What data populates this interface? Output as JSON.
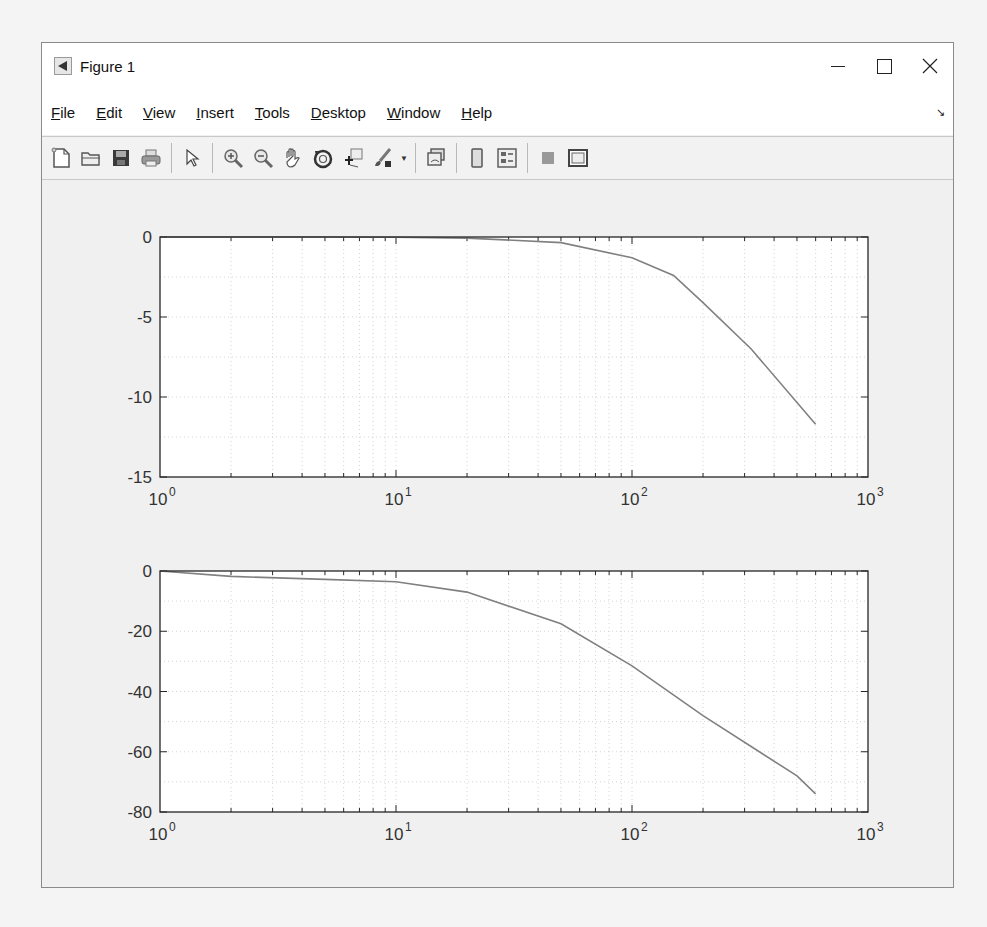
{
  "window": {
    "title": "Figure 1",
    "controls": [
      "minimize",
      "maximize",
      "close"
    ]
  },
  "menubar": {
    "items": [
      {
        "label": "File",
        "mnemonic": "F"
      },
      {
        "label": "Edit",
        "mnemonic": "E"
      },
      {
        "label": "View",
        "mnemonic": "V"
      },
      {
        "label": "Insert",
        "mnemonic": "I"
      },
      {
        "label": "Tools",
        "mnemonic": "T"
      },
      {
        "label": "Desktop",
        "mnemonic": "D"
      },
      {
        "label": "Window",
        "mnemonic": "W"
      },
      {
        "label": "Help",
        "mnemonic": "H"
      }
    ],
    "dock_arrow": "↘"
  },
  "toolbar": {
    "buttons": [
      {
        "name": "new-figure",
        "icon": "new-file-icon"
      },
      {
        "name": "open-file",
        "icon": "folder-open-icon"
      },
      {
        "name": "save",
        "icon": "save-icon"
      },
      {
        "name": "print",
        "icon": "printer-icon"
      },
      {
        "name": "edit-plot",
        "icon": "pointer-arrow-icon"
      },
      {
        "name": "zoom-in",
        "icon": "zoom-in-icon"
      },
      {
        "name": "zoom-out",
        "icon": "zoom-out-icon"
      },
      {
        "name": "pan",
        "icon": "hand-icon"
      },
      {
        "name": "rotate-3d",
        "icon": "rotate-3d-icon"
      },
      {
        "name": "data-cursor",
        "icon": "data-cursor-icon"
      },
      {
        "name": "brush",
        "icon": "brush-icon"
      },
      {
        "name": "link-plot",
        "icon": "link-plot-icon"
      },
      {
        "name": "colorbar",
        "icon": "colorbar-icon"
      },
      {
        "name": "legend",
        "icon": "legend-icon"
      },
      {
        "name": "hide-plot-tools",
        "icon": "hide-plot-tools-icon"
      },
      {
        "name": "show-plot-tools",
        "icon": "show-plot-tools-icon"
      }
    ]
  },
  "chart_data": [
    {
      "type": "line",
      "title": "",
      "xlabel": "",
      "ylabel": "",
      "xscale": "log",
      "xlim": [
        1,
        1000
      ],
      "ylim": [
        -15,
        0
      ],
      "grid": true,
      "xticks": [
        1,
        10,
        100,
        1000
      ],
      "xtick_labels": [
        "10^0",
        "10^1",
        "10^2",
        "10^3"
      ],
      "yticks": [
        0,
        -5,
        -10,
        -15
      ],
      "ytick_labels": [
        "0",
        "-5",
        "-10",
        "-15"
      ],
      "series": [
        {
          "name": "magnitude",
          "color": "#808080",
          "x": [
            1,
            2,
            5,
            10,
            20,
            50,
            100,
            150,
            200,
            320,
            600
          ],
          "y": [
            0,
            0,
            0,
            -0.02,
            -0.07,
            -0.35,
            -1.3,
            -2.4,
            -4.1,
            -7.0,
            -11.7
          ]
        }
      ]
    },
    {
      "type": "line",
      "title": "",
      "xlabel": "",
      "ylabel": "",
      "xscale": "log",
      "xlim": [
        1,
        1000
      ],
      "ylim": [
        -80,
        0
      ],
      "grid": true,
      "xticks": [
        1,
        10,
        100,
        1000
      ],
      "xtick_labels": [
        "10^0",
        "10^1",
        "10^2",
        "10^3"
      ],
      "yticks": [
        0,
        -20,
        -40,
        -60,
        -80
      ],
      "ytick_labels": [
        "0",
        "-20",
        "-40",
        "-60",
        "-80"
      ],
      "series": [
        {
          "name": "phase",
          "color": "#808080",
          "x": [
            1,
            2,
            5,
            10,
            20,
            50,
            100,
            200,
            500,
            600
          ],
          "y": [
            0,
            -1.8,
            -2.8,
            -3.6,
            -7,
            -17.5,
            -31.5,
            -48,
            -68,
            -74
          ]
        }
      ]
    }
  ],
  "axes_layout": [
    {
      "left": 160,
      "top": 237,
      "right": 868,
      "bottom": 477
    },
    {
      "left": 160,
      "top": 571,
      "right": 868,
      "bottom": 812
    }
  ]
}
